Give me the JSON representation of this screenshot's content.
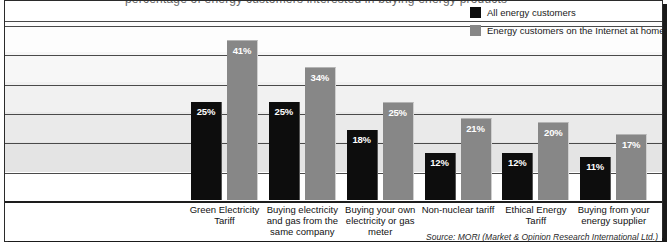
{
  "headline": {
    "cropped_text": "percentage of energy customers interested in buying energy products"
  },
  "legend": {
    "items": [
      {
        "label": "All energy customers",
        "color": "#0d0d0d",
        "swatch_name": "legend-swatch-black"
      },
      {
        "label": "Energy customers on the Internet at home",
        "color": "#878787",
        "swatch_name": "legend-swatch-grey"
      }
    ]
  },
  "source": {
    "text": "Source: MORI (Market & Opinion Research International Ltd.)"
  },
  "chart_data": {
    "type": "bar",
    "title": "",
    "xlabel": "",
    "ylabel": "",
    "ylim": [
      0,
      45
    ],
    "grid": true,
    "gridlines": [
      0,
      7.5,
      15,
      22.5,
      30,
      37.5,
      45
    ],
    "legend_position": "top-right",
    "value_suffix": "%",
    "categories": [
      "Green Electricity Tariff",
      "Buying electricity and gas from the same company",
      "Buying your own electricity or gas meter",
      "Non-nuclear tariff",
      "Ethical Energy Tariff",
      "Buying from your energy supplier"
    ],
    "series": [
      {
        "name": "All energy customers",
        "color": "#0d0d0d",
        "values": [
          25,
          25,
          18,
          12,
          12,
          11
        ]
      },
      {
        "name": "Energy customers on the Internet at home",
        "color": "#878787",
        "values": [
          41,
          34,
          25,
          21,
          20,
          17
        ]
      }
    ],
    "labels": {
      "series_0": [
        "25%",
        "25%",
        "18%",
        "12%",
        "12%",
        "11%"
      ],
      "series_1": [
        "41%",
        "34%",
        "25%",
        "21%",
        "20%",
        "17%"
      ]
    }
  }
}
